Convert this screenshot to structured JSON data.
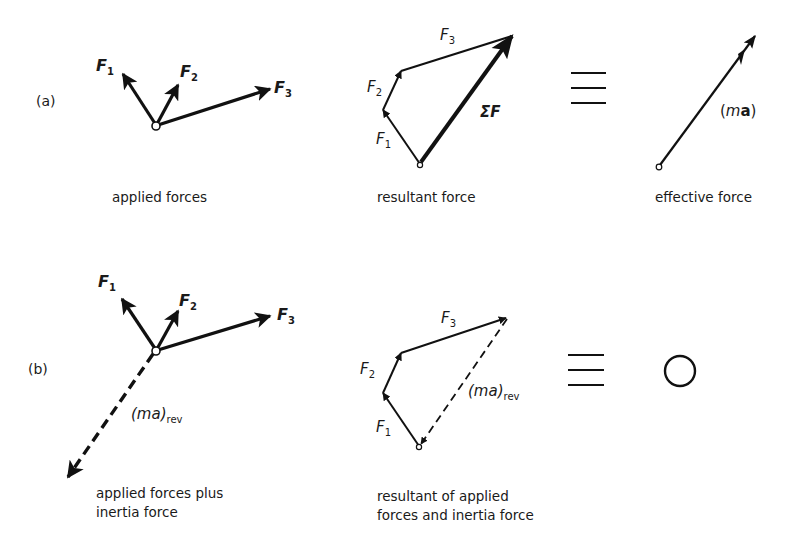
{
  "rows": {
    "a": {
      "label": "(a)",
      "applied": {
        "caption": "applied forces",
        "forces": [
          {
            "name": "F",
            "sub": "1"
          },
          {
            "name": "F",
            "sub": "2"
          },
          {
            "name": "F",
            "sub": "3"
          }
        ]
      },
      "resultant": {
        "caption": "resultant force",
        "sides": [
          {
            "name": "F",
            "sub": "1"
          },
          {
            "name": "F",
            "sub": "2"
          },
          {
            "name": "F",
            "sub": "3"
          }
        ],
        "sum_label": "ΣF"
      },
      "equivalence_symbol": "≡",
      "effective": {
        "caption": "effective force",
        "vector_label_open": "(",
        "vector_label_m": "m",
        "vector_label_a": "a",
        "vector_label_close": ")"
      }
    },
    "b": {
      "label": "(b)",
      "applied": {
        "caption_line1": "applied forces plus",
        "caption_line2": "inertia force",
        "forces": [
          {
            "name": "F",
            "sub": "1"
          },
          {
            "name": "F",
            "sub": "2"
          },
          {
            "name": "F",
            "sub": "3"
          }
        ],
        "inertia_label": "(ma)",
        "inertia_sub": "rev"
      },
      "resultant": {
        "caption_line1": "resultant of applied",
        "caption_line2": "forces and inertia force",
        "sides": [
          {
            "name": "F",
            "sub": "1"
          },
          {
            "name": "F",
            "sub": "2"
          },
          {
            "name": "F",
            "sub": "3"
          }
        ],
        "inertia_label": "(ma)",
        "inertia_sub": "rev"
      },
      "equivalence_symbol": "≡",
      "result_symbol": "zero-circle"
    }
  },
  "colors": {
    "ink": "#111111",
    "background": "#ffffff"
  }
}
